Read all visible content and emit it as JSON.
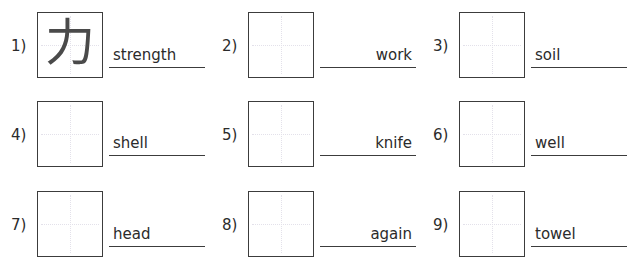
{
  "worksheet": {
    "items": [
      {
        "number": "1)",
        "kanji": "力",
        "word": "strength",
        "align": "left"
      },
      {
        "number": "2)",
        "kanji": "",
        "word": "work",
        "align": "right"
      },
      {
        "number": "3)",
        "kanji": "",
        "word": "soil",
        "align": "left"
      },
      {
        "number": "4)",
        "kanji": "",
        "word": "shell",
        "align": "left"
      },
      {
        "number": "5)",
        "kanji": "",
        "word": "knife",
        "align": "right"
      },
      {
        "number": "6)",
        "kanji": "",
        "word": "well",
        "align": "left"
      },
      {
        "number": "7)",
        "kanji": "",
        "word": "head",
        "align": "left"
      },
      {
        "number": "8)",
        "kanji": "",
        "word": "again",
        "align": "right"
      },
      {
        "number": "9)",
        "kanji": "",
        "word": "towel",
        "align": "left"
      }
    ]
  },
  "colors": {
    "ink": "#2b2b2b",
    "border": "#3c3c3c",
    "kanji": "#4a4a4a",
    "guide": "#e3e1ea",
    "background": "#ffffff"
  }
}
